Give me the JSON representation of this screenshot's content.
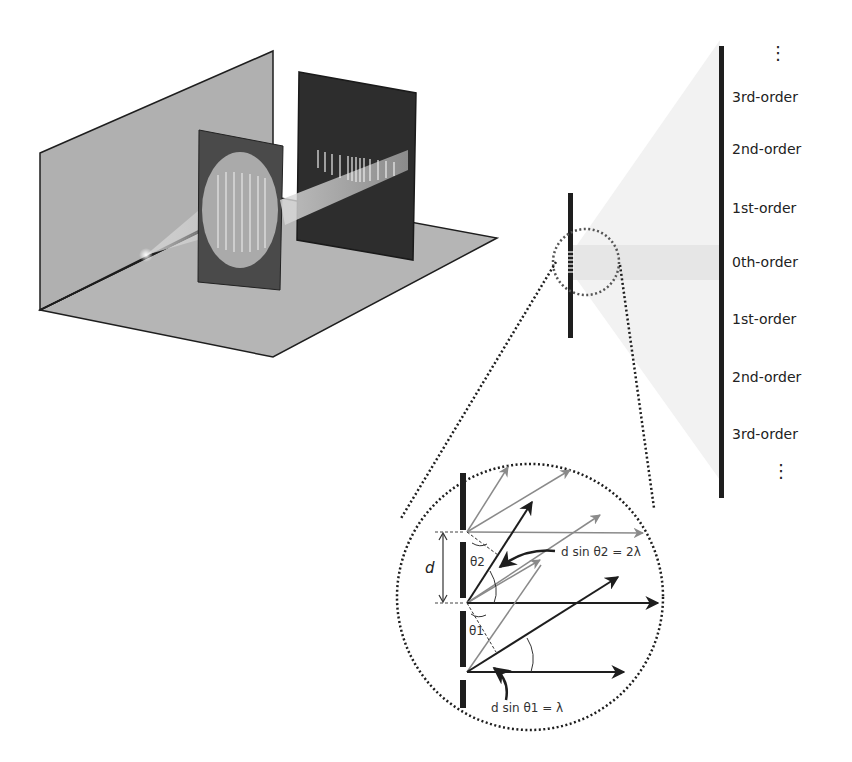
{
  "diagram": {
    "orders": [
      {
        "label": "3rd-order",
        "y": 98
      },
      {
        "label": "2nd-order",
        "y": 150
      },
      {
        "label": "1st-order",
        "y": 208
      },
      {
        "label": "0th-order",
        "y": 262
      },
      {
        "label": "1st-order",
        "y": 320
      },
      {
        "label": "2nd-order",
        "y": 378
      },
      {
        "label": "3rd-order",
        "y": 435
      }
    ],
    "ellipsis_top": "⋮",
    "ellipsis_bottom": "⋮",
    "inset": {
      "d_label": "d",
      "theta1_label": "θ1",
      "theta2_label": "θ2",
      "eq1": "d sin θ1 = λ",
      "eq2": "d sin θ2 = 2λ"
    },
    "colors": {
      "wall": "#b3b3b3",
      "panel": "#3a3a3a",
      "screen": "#2b2b2b",
      "ink": "#1e1e1e",
      "gray_arrow": "#8a8a8a"
    }
  }
}
